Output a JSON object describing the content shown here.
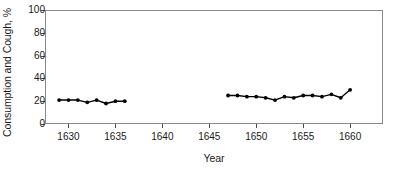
{
  "chart_data": {
    "type": "line",
    "title": "",
    "xlabel": "Year",
    "ylabel": "Consumption and Cough, %",
    "xlim": [
      1627.5,
      1663.5
    ],
    "ylim": [
      0,
      100
    ],
    "grid": false,
    "legend": null,
    "xticks": [
      1630,
      1635,
      1640,
      1645,
      1650,
      1655,
      1660
    ],
    "yticks": [
      0,
      20,
      40,
      60,
      80,
      100
    ],
    "marker": "filled-circle",
    "line_color": "#000000",
    "series": [
      {
        "name": "Consumption and Cough (early period)",
        "x": [
          1629,
          1630,
          1631,
          1632,
          1633,
          1634,
          1635,
          1636
        ],
        "values": [
          21,
          21,
          21,
          19,
          21,
          18,
          20,
          20
        ]
      },
      {
        "name": "Consumption and Cough (later period)",
        "x": [
          1647,
          1648,
          1649,
          1650,
          1651,
          1652,
          1653,
          1654,
          1655,
          1656,
          1657,
          1658,
          1659,
          1660
        ],
        "values": [
          25,
          25,
          24,
          24,
          23,
          21,
          24,
          23,
          25,
          25,
          24,
          26,
          23,
          30
        ]
      }
    ],
    "note": "Gap in data between 1636 and 1647"
  },
  "axes": {
    "y_title": "Consumption and Cough, %",
    "x_title": "Year",
    "y_tick_labels": [
      "100",
      "80",
      "60",
      "40",
      "20",
      "0"
    ],
    "x_tick_labels": [
      "1630",
      "1635",
      "1640",
      "1645",
      "1650",
      "1655",
      "1660"
    ]
  }
}
